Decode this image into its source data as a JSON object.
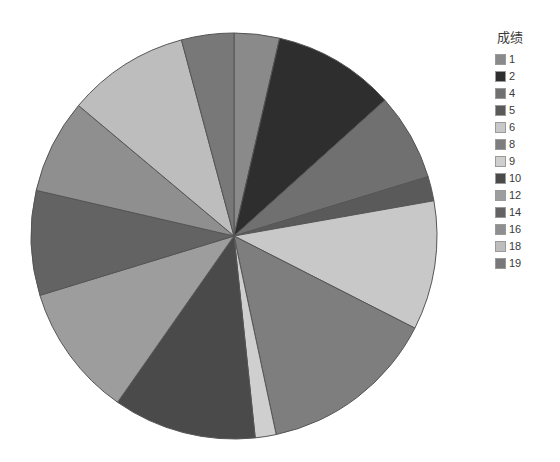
{
  "chart_data": {
    "type": "pie",
    "title": "",
    "legend_title": "成绩",
    "legend_position": "right",
    "start_angle_deg": 0,
    "direction": "clockwise",
    "center": {
      "x": 234,
      "y": 236
    },
    "radius": 203,
    "stroke": "#555555",
    "categories": [
      "1",
      "2",
      "4",
      "5",
      "6",
      "8",
      "9",
      "10",
      "12",
      "14",
      "16",
      "18",
      "19"
    ],
    "values": [
      13,
      35,
      25,
      7,
      37,
      51,
      6,
      41,
      38,
      30,
      27,
      35,
      15
    ],
    "percentages": [
      3.6,
      9.7,
      6.9,
      1.9,
      10.3,
      14.2,
      1.7,
      11.4,
      10.6,
      8.3,
      7.5,
      9.7,
      4.2
    ],
    "colors": [
      "#8a8a8a",
      "#2e2e2e",
      "#707070",
      "#5a5a5a",
      "#c8c8c8",
      "#7e7e7e",
      "#cfcfcf",
      "#4a4a4a",
      "#9d9d9d",
      "#636363",
      "#8f8f8f",
      "#bdbdbd",
      "#787878"
    ],
    "slices": [
      {
        "label": "1",
        "value": 13,
        "start_deg": 0,
        "end_deg": 13,
        "color": "#8a8a8a"
      },
      {
        "label": "2",
        "value": 35,
        "start_deg": 13,
        "end_deg": 48,
        "color": "#2e2e2e"
      },
      {
        "label": "4",
        "value": 25,
        "start_deg": 48,
        "end_deg": 73,
        "color": "#707070"
      },
      {
        "label": "5",
        "value": 7,
        "start_deg": 73,
        "end_deg": 80,
        "color": "#5a5a5a"
      },
      {
        "label": "6",
        "value": 37,
        "start_deg": 80,
        "end_deg": 117,
        "color": "#c8c8c8"
      },
      {
        "label": "8",
        "value": 51,
        "start_deg": 117,
        "end_deg": 168,
        "color": "#7e7e7e"
      },
      {
        "label": "9",
        "value": 6,
        "start_deg": 168,
        "end_deg": 174,
        "color": "#cfcfcf"
      },
      {
        "label": "10",
        "value": 41,
        "start_deg": 174,
        "end_deg": 215,
        "color": "#4a4a4a"
      },
      {
        "label": "12",
        "value": 38,
        "start_deg": 215,
        "end_deg": 253,
        "color": "#9d9d9d"
      },
      {
        "label": "14",
        "value": 30,
        "start_deg": 253,
        "end_deg": 283,
        "color": "#636363"
      },
      {
        "label": "16",
        "value": 27,
        "start_deg": 283,
        "end_deg": 310,
        "color": "#8f8f8f"
      },
      {
        "label": "18",
        "value": 35,
        "start_deg": 310,
        "end_deg": 345,
        "color": "#bdbdbd"
      },
      {
        "label": "19",
        "value": 15,
        "start_deg": 345,
        "end_deg": 360,
        "color": "#787878"
      }
    ]
  },
  "legend": {
    "title": "成绩",
    "items": [
      {
        "label": "1",
        "color": "#8a8a8a"
      },
      {
        "label": "2",
        "color": "#2e2e2e"
      },
      {
        "label": "4",
        "color": "#707070"
      },
      {
        "label": "5",
        "color": "#5a5a5a"
      },
      {
        "label": "6",
        "color": "#c8c8c8"
      },
      {
        "label": "8",
        "color": "#7e7e7e"
      },
      {
        "label": "9",
        "color": "#cfcfcf"
      },
      {
        "label": "10",
        "color": "#4a4a4a"
      },
      {
        "label": "12",
        "color": "#9d9d9d"
      },
      {
        "label": "14",
        "color": "#636363"
      },
      {
        "label": "16",
        "color": "#8f8f8f"
      },
      {
        "label": "18",
        "color": "#bdbdbd"
      },
      {
        "label": "19",
        "color": "#787878"
      }
    ]
  }
}
